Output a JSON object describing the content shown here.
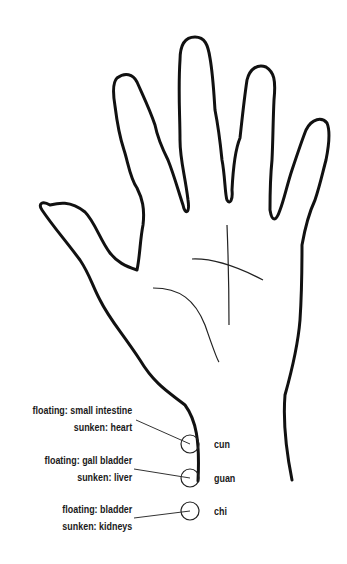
{
  "diagram": {
    "colors": {
      "outline": "#111111",
      "line": "#222222",
      "text": "#1a1a1a",
      "background": "#ffffff"
    },
    "positions": [
      {
        "name": "cun",
        "floating": "floating: small intestine",
        "sunken": "sunken: heart"
      },
      {
        "name": "guan",
        "floating": "floating: gall bladder",
        "sunken": "sunken: liver"
      },
      {
        "name": "chi",
        "floating": "floating: bladder",
        "sunken": "sunken: kidneys"
      }
    ]
  }
}
